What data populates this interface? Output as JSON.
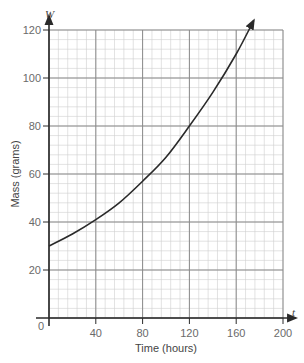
{
  "chart_data": {
    "type": "line",
    "title": "",
    "xlabel": "Time (hours)",
    "ylabel": "Mass (grams)",
    "x_variable": "t",
    "y_variable": "W",
    "xlim": [
      0,
      200
    ],
    "ylim": [
      0,
      120
    ],
    "x_ticks": [
      0,
      40,
      80,
      120,
      160,
      200
    ],
    "x_tick_labels": [
      "40",
      "80",
      "120",
      "160",
      "200"
    ],
    "y_ticks": [
      20,
      40,
      60,
      80,
      100,
      120
    ],
    "y_tick_labels": [
      "20",
      "40",
      "60",
      "80",
      "100",
      "120"
    ],
    "origin_label": "0",
    "grid": true,
    "grid_major_x": 40,
    "grid_major_y": 20,
    "grid_minor_x": 8,
    "grid_minor_y": 4,
    "legend": null,
    "series": [
      {
        "name": "W",
        "arrow_end": true,
        "x": [
          0,
          20,
          40,
          60,
          80,
          100,
          120,
          140,
          160,
          175
        ],
        "values": [
          30,
          35,
          41,
          48,
          57,
          67,
          80,
          94,
          110,
          124
        ]
      }
    ],
    "colors": {
      "curve": "#2a2a2a",
      "axis": "#2a2a2a",
      "grid_major": "#8a8a8a",
      "grid_minor": "#cfcfcf",
      "labels": "#6a6a6a"
    }
  }
}
